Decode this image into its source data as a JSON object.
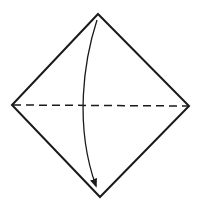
{
  "diagram": {
    "type": "origami-fold-step",
    "colors": {
      "line": "#1a1a1a",
      "background": "#ffffff"
    },
    "shape": {
      "top": [
        98,
        14
      ],
      "right": [
        189,
        106
      ],
      "bottom": [
        100,
        197
      ],
      "left": [
        12,
        105
      ]
    },
    "fold_line": {
      "style": "dashed",
      "from": [
        12,
        105
      ],
      "to": [
        189,
        106
      ]
    },
    "arrow": {
      "from": [
        97,
        20
      ],
      "to": [
        98,
        187
      ],
      "direction": "down"
    }
  }
}
